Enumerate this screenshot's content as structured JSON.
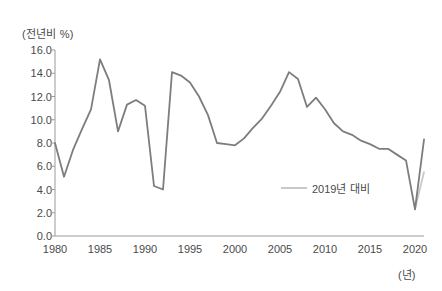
{
  "chart_data": {
    "type": "line",
    "title": "(전년비 %)",
    "xlabel": "(년)",
    "ylabel": "(전년비 %)",
    "xlim": [
      1980,
      2021
    ],
    "ylim": [
      0.0,
      16.0
    ],
    "grid": false,
    "legend_position": "inside-right",
    "x_ticks": [
      "1980",
      "1985",
      "1990",
      "1995",
      "2000",
      "2005",
      "2010",
      "2015",
      "2020"
    ],
    "x_tick_values": [
      1980,
      1985,
      1990,
      1995,
      2000,
      2005,
      2010,
      2015,
      2020
    ],
    "y_ticks": [
      "0.0",
      "2.0",
      "4.0",
      "6.0",
      "8.0",
      "10.0",
      "12.0",
      "14.0",
      "16.0"
    ],
    "y_tick_values": [
      0.0,
      2.0,
      4.0,
      6.0,
      8.0,
      10.0,
      12.0,
      14.0,
      16.0
    ],
    "series": [
      {
        "name": "전년비",
        "color": "#7d7d7d",
        "x": [
          1980,
          1981,
          1982,
          1983,
          1984,
          1985,
          1986,
          1987,
          1988,
          1989,
          1990,
          1991,
          1992,
          1993,
          1994,
          1995,
          1996,
          1997,
          1998,
          1999,
          2000,
          2001,
          2002,
          2003,
          2004,
          2005,
          2006,
          2007,
          2008,
          2009,
          2010,
          2011,
          2012,
          2013,
          2014,
          2015,
          2016,
          2017,
          2018,
          2019,
          2020,
          2021
        ],
        "values": [
          8.0,
          5.1,
          7.4,
          9.2,
          10.9,
          15.2,
          13.4,
          9.0,
          11.3,
          11.7,
          11.2,
          4.3,
          4.0,
          14.1,
          13.8,
          13.2,
          12.0,
          10.4,
          8.0,
          7.9,
          7.8,
          8.4,
          9.3,
          10.1,
          11.2,
          12.4,
          14.1,
          13.5,
          11.1,
          11.9,
          10.9,
          9.7,
          9.0,
          8.7,
          8.2,
          7.9,
          7.5,
          7.5,
          7.0,
          6.5,
          2.3,
          8.3
        ]
      },
      {
        "name": "2019년 대비",
        "color": "#c9c9c9",
        "x": [
          2020,
          2021
        ],
        "values": [
          2.3,
          5.5
        ]
      }
    ],
    "legend": [
      {
        "label": "2019년 대비",
        "color": "#c9c9c9"
      }
    ]
  },
  "legend": {
    "entry_label": "2019년 대비"
  },
  "axes": {
    "y_axis_title": "(전년비 %)",
    "x_axis_unit": "(년)"
  },
  "colors": {
    "main_line": "#7d7d7d",
    "compare_line": "#c9c9c9",
    "axis": "#9a9a9a",
    "text": "#4a4a4a",
    "background": "#ffffff"
  }
}
